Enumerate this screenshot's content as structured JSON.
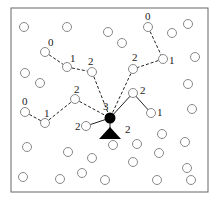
{
  "diagram": {
    "frame": {
      "x": 11,
      "y": 8,
      "w": 197,
      "h": 184
    },
    "colors": {
      "node_stroke": "#888888",
      "edge": "#222222",
      "head": "#000000",
      "frame": "#666666"
    },
    "cluster_head": {
      "x": 110,
      "y": 118,
      "r": 5.5,
      "label": "3",
      "label_x": 103,
      "label_y": 110
    },
    "sink": {
      "apex_x": 110,
      "apex_y": 127,
      "base_y": 139,
      "half_w": 11,
      "label": "2",
      "label_x": 125,
      "label_y": 133
    },
    "nodes": [
      {
        "x": 24,
        "y": 27
      },
      {
        "x": 67,
        "y": 27
      },
      {
        "x": 108,
        "y": 32
      },
      {
        "x": 122,
        "y": 43
      },
      {
        "x": 148,
        "y": 27
      },
      {
        "x": 172,
        "y": 33
      },
      {
        "x": 188,
        "y": 24
      },
      {
        "x": 195,
        "y": 57
      },
      {
        "x": 163,
        "y": 59
      },
      {
        "x": 133,
        "y": 69
      },
      {
        "x": 45,
        "y": 52
      },
      {
        "x": 67,
        "y": 67
      },
      {
        "x": 92,
        "y": 72
      },
      {
        "x": 25,
        "y": 73
      },
      {
        "x": 40,
        "y": 83
      },
      {
        "x": 75,
        "y": 99
      },
      {
        "x": 25,
        "y": 112
      },
      {
        "x": 45,
        "y": 123
      },
      {
        "x": 133,
        "y": 93
      },
      {
        "x": 151,
        "y": 113
      },
      {
        "x": 86,
        "y": 126
      },
      {
        "x": 188,
        "y": 84
      },
      {
        "x": 192,
        "y": 109
      },
      {
        "x": 162,
        "y": 134
      },
      {
        "x": 137,
        "y": 144
      },
      {
        "x": 185,
        "y": 142
      },
      {
        "x": 159,
        "y": 153
      },
      {
        "x": 133,
        "y": 162
      },
      {
        "x": 187,
        "y": 168
      },
      {
        "x": 157,
        "y": 180
      },
      {
        "x": 191,
        "y": 180
      },
      {
        "x": 27,
        "y": 147
      },
      {
        "x": 68,
        "y": 152
      },
      {
        "x": 92,
        "y": 158
      },
      {
        "x": 113,
        "y": 145
      },
      {
        "x": 23,
        "y": 177
      },
      {
        "x": 60,
        "y": 179
      },
      {
        "x": 82,
        "y": 173
      },
      {
        "x": 105,
        "y": 180
      }
    ],
    "dashed_edges": [
      [
        45,
        52,
        67,
        67
      ],
      [
        67,
        67,
        92,
        72
      ],
      [
        92,
        72,
        110,
        118
      ],
      [
        148,
        27,
        163,
        59
      ],
      [
        163,
        59,
        133,
        69
      ],
      [
        133,
        69,
        110,
        118
      ],
      [
        25,
        112,
        45,
        123
      ],
      [
        45,
        123,
        75,
        99
      ],
      [
        75,
        99,
        110,
        118
      ]
    ],
    "solid_edges": [
      [
        110,
        118,
        133,
        93
      ],
      [
        133,
        93,
        151,
        113
      ],
      [
        110,
        118,
        86,
        126
      ],
      [
        110,
        118,
        110,
        128
      ]
    ],
    "labels": [
      {
        "text": "0",
        "x": 48,
        "y": 46
      },
      {
        "text": "1",
        "x": 70,
        "y": 62
      },
      {
        "text": "2",
        "x": 88,
        "y": 65
      },
      {
        "text": "0",
        "x": 145,
        "y": 20
      },
      {
        "text": "1",
        "x": 169,
        "y": 64
      },
      {
        "text": "2",
        "x": 132,
        "y": 61
      },
      {
        "text": "0",
        "x": 22,
        "y": 105
      },
      {
        "text": "1",
        "x": 44,
        "y": 117
      },
      {
        "text": "2",
        "x": 74,
        "y": 93
      },
      {
        "text": "2",
        "x": 140,
        "y": 94
      },
      {
        "text": "1",
        "x": 157,
        "y": 116
      },
      {
        "text": "2",
        "x": 75,
        "y": 130
      }
    ]
  }
}
